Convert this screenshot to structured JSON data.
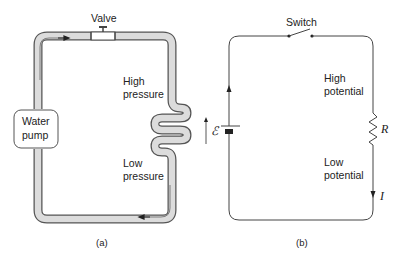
{
  "panel_a": {
    "caption": "(a)",
    "valve_label": "Valve",
    "pump_label_line1": "Water",
    "pump_label_line2": "pump",
    "high_label_line1": "High",
    "high_label_line2": "pressure",
    "low_label_line1": "Low",
    "low_label_line2": "pressure"
  },
  "panel_b": {
    "caption": "(b)",
    "switch_label": "Switch",
    "high_label_line1": "High",
    "high_label_line2": "potential",
    "low_label_line1": "Low",
    "low_label_line2": "potential",
    "emf_symbol": "ℰ",
    "resistor_symbol": "R",
    "current_symbol": "I"
  },
  "colors": {
    "pipe_fill": "#dcdcdc",
    "pipe_stroke": "#555555",
    "wire": "#444444",
    "text": "#222222"
  }
}
